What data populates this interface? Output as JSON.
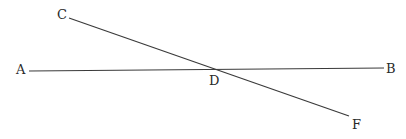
{
  "diagram": {
    "type": "intersecting-lines",
    "stroke_color": "#3a3a3a",
    "label_color": "#2a2a2a",
    "points": {
      "A": {
        "label": "A"
      },
      "B": {
        "label": "B"
      },
      "C": {
        "label": "C"
      },
      "D": {
        "label": "D"
      },
      "F": {
        "label": "F"
      }
    },
    "lines": [
      {
        "name": "AB",
        "from": "A",
        "to": "B"
      },
      {
        "name": "CF",
        "from": "C",
        "to": "F"
      }
    ],
    "intersection": "D"
  }
}
